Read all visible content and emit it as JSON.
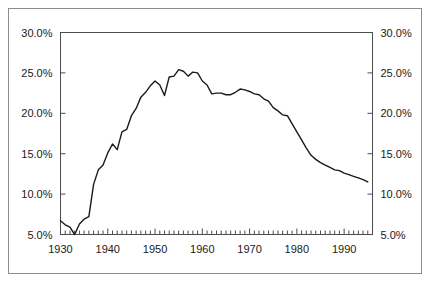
{
  "figure": {
    "width": 432,
    "height": 284,
    "background_color": "#ffffff",
    "frame_color": "#8c8c8c",
    "line_color": "#1a1a1a",
    "axis_color": "#4d4d4d"
  },
  "chart_data": {
    "type": "line",
    "title": "",
    "subtitle": "",
    "xlabel": "",
    "ylabel": "",
    "ylabel_right": "",
    "xlim": [
      1930,
      1996
    ],
    "ylim": [
      5.0,
      30.0
    ],
    "grid": false,
    "legend": "none",
    "y_tick_labels": [
      "30.0%",
      "25.0%",
      "20.0%",
      "15.0%",
      "10.0%",
      "5.0%"
    ],
    "y_ticks": [
      30.0,
      25.0,
      20.0,
      15.0,
      10.0,
      5.0
    ],
    "y_tick_labels_right": [
      "30.0%",
      "25.0%",
      "20.0%",
      "15.0%",
      "10.0%",
      "5.0%"
    ],
    "x_tick_labels": [
      "1930",
      "1940",
      "1950",
      "1960",
      "1970",
      "1980",
      "1990"
    ],
    "x_ticks": [
      1930,
      1940,
      1950,
      1960,
      1970,
      1980,
      1990
    ],
    "x_minor_tick_interval": 1,
    "series": [
      {
        "name": "Union membership rate",
        "color": "#1a1a1a",
        "x": [
          1930,
          1931,
          1932,
          1933,
          1934,
          1935,
          1936,
          1937,
          1938,
          1939,
          1940,
          1941,
          1942,
          1943,
          1944,
          1945,
          1946,
          1947,
          1948,
          1949,
          1950,
          1951,
          1952,
          1953,
          1954,
          1955,
          1956,
          1957,
          1958,
          1959,
          1960,
          1961,
          1962,
          1963,
          1964,
          1965,
          1966,
          1967,
          1968,
          1969,
          1970,
          1971,
          1972,
          1973,
          1974,
          1975,
          1976,
          1977,
          1978,
          1979,
          1980,
          1981,
          1982,
          1983,
          1984,
          1985,
          1986,
          1987,
          1988,
          1989,
          1990,
          1991,
          1992,
          1993,
          1994,
          1995
        ],
        "values": [
          6.7,
          6.2,
          5.9,
          5.0,
          6.3,
          6.9,
          7.2,
          11.2,
          13.0,
          13.6,
          15.1,
          16.2,
          15.5,
          17.7,
          18.0,
          19.7,
          20.6,
          22.0,
          22.6,
          23.4,
          24.0,
          23.5,
          22.2,
          24.5,
          24.6,
          25.4,
          25.2,
          24.6,
          25.1,
          25.0,
          24.0,
          23.5,
          22.4,
          22.5,
          22.5,
          22.3,
          22.3,
          22.6,
          23.0,
          22.9,
          22.7,
          22.4,
          22.3,
          21.8,
          21.5,
          20.7,
          20.3,
          19.8,
          19.7,
          18.7,
          17.7,
          16.7,
          15.7,
          14.8,
          14.3,
          13.9,
          13.6,
          13.3,
          13.0,
          12.9,
          12.6,
          12.4,
          12.2,
          12.0,
          11.8,
          11.5
        ]
      }
    ]
  },
  "accessible": {
    "description": "Line chart of union membership rate from 1930 to 1995, rising sharply from about 5 percent in 1933 to a peak near 25.4 percent in the mid 1950s, then declining steadily to about 11.5 percent in 1995."
  }
}
